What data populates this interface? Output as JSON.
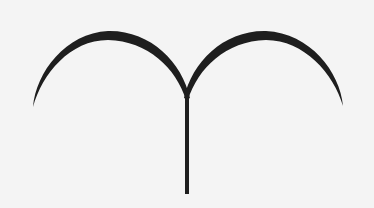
{
  "figure": {
    "symbol_name": "Aries",
    "glyph": "♈",
    "colors": {
      "background": "#f4f4f4",
      "stroke": "#1e1e1e"
    }
  }
}
